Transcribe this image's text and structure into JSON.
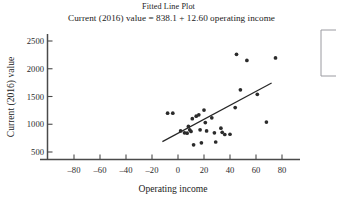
{
  "chart_data": {
    "type": "scatter",
    "title": "Fitted Line Plot",
    "subtitle": "Current (2016) value = 838.1 + 12.60 operating income",
    "xlabel": "Operating income",
    "ylabel": "Current (2016) value",
    "xlim": [
      -95,
      92
    ],
    "ylim": [
      370,
      2620
    ],
    "xticks": [
      -80,
      -60,
      -40,
      -20,
      0,
      20,
      40,
      60,
      80
    ],
    "xtick_labels": [
      "–80",
      "–60",
      "–40",
      "–20",
      "0",
      "20",
      "40",
      "60",
      "80"
    ],
    "yticks": [
      500,
      1000,
      1500,
      2000,
      2500
    ],
    "ytick_labels": [
      "500",
      "1000",
      "1500",
      "2000",
      "2500"
    ],
    "grid": false,
    "legend": "",
    "fit_line": {
      "intercept": 838.1,
      "slope": 12.6,
      "x_start": -12,
      "x_end": 72,
      "y_start": 687,
      "y_end": 1745
    },
    "points": [
      {
        "x": -8,
        "y": 1200
      },
      {
        "x": -4,
        "y": 1200
      },
      {
        "x": 2,
        "y": 880
      },
      {
        "x": 5,
        "y": 845
      },
      {
        "x": 7,
        "y": 840
      },
      {
        "x": 8,
        "y": 960
      },
      {
        "x": 9,
        "y": 900
      },
      {
        "x": 10,
        "y": 870
      },
      {
        "x": 11,
        "y": 1100
      },
      {
        "x": 12,
        "y": 630
      },
      {
        "x": 14,
        "y": 1145
      },
      {
        "x": 16,
        "y": 1170
      },
      {
        "x": 17,
        "y": 900
      },
      {
        "x": 18,
        "y": 665
      },
      {
        "x": 20,
        "y": 1255
      },
      {
        "x": 21,
        "y": 1030
      },
      {
        "x": 22,
        "y": 880
      },
      {
        "x": 26,
        "y": 1115
      },
      {
        "x": 28,
        "y": 845
      },
      {
        "x": 29,
        "y": 680
      },
      {
        "x": 33,
        "y": 930
      },
      {
        "x": 34,
        "y": 855
      },
      {
        "x": 36,
        "y": 815
      },
      {
        "x": 40,
        "y": 820
      },
      {
        "x": 44,
        "y": 1300
      },
      {
        "x": 45,
        "y": 2260
      },
      {
        "x": 48,
        "y": 1620
      },
      {
        "x": 53,
        "y": 2150
      },
      {
        "x": 61,
        "y": 1540
      },
      {
        "x": 68,
        "y": 1040
      },
      {
        "x": 75,
        "y": 2195
      }
    ]
  },
  "legend_box": {
    "label": ""
  }
}
